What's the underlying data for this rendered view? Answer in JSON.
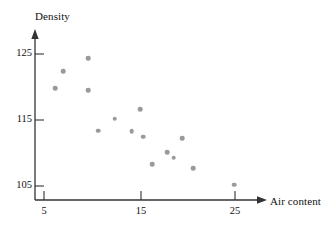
{
  "chart_data": {
    "type": "scatter",
    "title": "",
    "xlabel": "Air content",
    "ylabel": "Density",
    "xlim": [
      2.5,
      28
    ],
    "ylim": [
      102,
      127.5
    ],
    "xticks": [
      5,
      15,
      25
    ],
    "xtick_labels": [
      "5",
      "15",
      "25"
    ],
    "yticks": [
      105,
      115,
      125
    ],
    "ytick_labels": [
      "105",
      "115",
      "125"
    ],
    "grid": false,
    "legend": null,
    "marker": {
      "shape": "circle",
      "color": "#9a9a9a",
      "size": 4.6
    },
    "axis_style": {
      "color": "#333333",
      "arrow_x": true,
      "arrow_y": true,
      "spine_left_x": 5,
      "spine_bottom_y": 104
    },
    "points": [
      {
        "x": 6.2,
        "y": 119.8
      },
      {
        "x": 7.0,
        "y": 122.4
      },
      {
        "x": 9.6,
        "y": 124.4
      },
      {
        "x": 9.6,
        "y": 119.5
      },
      {
        "x": 10.7,
        "y": 113.4
      },
      {
        "x": 12.4,
        "y": 115.2
      },
      {
        "x": 14.2,
        "y": 113.3
      },
      {
        "x": 15.1,
        "y": 116.6
      },
      {
        "x": 15.4,
        "y": 112.5
      },
      {
        "x": 16.3,
        "y": 108.3
      },
      {
        "x": 17.9,
        "y": 110.1
      },
      {
        "x": 18.6,
        "y": 109.3
      },
      {
        "x": 19.5,
        "y": 112.2
      },
      {
        "x": 20.6,
        "y": 107.7
      },
      {
        "x": 24.9,
        "y": 105.2
      }
    ]
  },
  "labels": {
    "y_axis_title": "Density",
    "x_axis_title": "Air content"
  },
  "colors": {
    "marker": "#9a9a9a",
    "axis": "#333333",
    "text": "#111111",
    "background": "#ffffff"
  }
}
